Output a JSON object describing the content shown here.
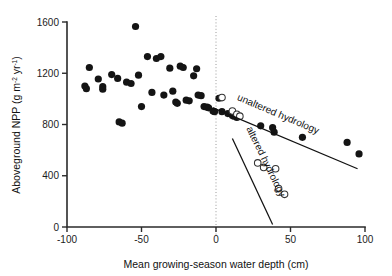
{
  "chart_data": {
    "type": "scatter",
    "title": "",
    "xlabel": "Mean growing-season water depth (cm)",
    "ylabel": "Aboveground NPP (g m-2 yr-1)",
    "ylabel_parts": {
      "prefix": "Aboveground NPP (g m",
      "sup1": "-2",
      "mid": " yr",
      "sup2": "-1",
      "suffix": ")"
    },
    "xlim": [
      -100,
      100
    ],
    "ylim": [
      0,
      1600
    ],
    "xticks": [
      -100,
      -50,
      0,
      50,
      100
    ],
    "xticklabels": [
      "-100",
      "-50",
      "0",
      "50",
      "100"
    ],
    "yticks": [
      0,
      400,
      800,
      1200,
      1600
    ],
    "yticklabels": [
      "0",
      "400",
      "800",
      "1200",
      "1600"
    ],
    "grid": false,
    "legend_position": "inline-annotation",
    "reference_lines": [
      {
        "name": "zero-water-depth",
        "orientation": "vertical",
        "value": 0,
        "style": "dotted",
        "color": "#9a9a9a"
      }
    ],
    "series": [
      {
        "name": "unaltered hydrology",
        "marker": "filled-circle",
        "color": "#141414",
        "points": [
          [
            -88,
            1100
          ],
          [
            -87,
            1080
          ],
          [
            -85,
            1245
          ],
          [
            -79,
            1155
          ],
          [
            -76,
            1095
          ],
          [
            -76,
            1075
          ],
          [
            -70,
            1190
          ],
          [
            -66,
            1160
          ],
          [
            -65,
            820
          ],
          [
            -63,
            810
          ],
          [
            -60,
            1130
          ],
          [
            -57,
            1120
          ],
          [
            -54,
            1565
          ],
          [
            -52,
            1185
          ],
          [
            -50,
            940
          ],
          [
            -46,
            1330
          ],
          [
            -43,
            1050
          ],
          [
            -40,
            1315
          ],
          [
            -37,
            1330
          ],
          [
            -35,
            1030
          ],
          [
            -31,
            1240
          ],
          [
            -29,
            1060
          ],
          [
            -27,
            975
          ],
          [
            -26,
            965
          ],
          [
            -24,
            1255
          ],
          [
            -22,
            1245
          ],
          [
            -20,
            990
          ],
          [
            -18,
            985
          ],
          [
            -15,
            1180
          ],
          [
            -13,
            1235
          ],
          [
            -12,
            1030
          ],
          [
            -10,
            1025
          ],
          [
            -8,
            940
          ],
          [
            -6,
            935
          ],
          [
            -5,
            930
          ],
          [
            -2,
            905
          ],
          [
            -1,
            900
          ],
          [
            2,
            1005
          ],
          [
            4,
            900
          ],
          [
            8,
            885
          ],
          [
            11,
            870
          ],
          [
            12,
            865
          ],
          [
            14,
            855
          ],
          [
            30,
            790
          ],
          [
            38,
            775
          ],
          [
            39,
            740
          ],
          [
            58,
            700
          ],
          [
            88,
            660
          ],
          [
            96,
            570
          ]
        ]
      },
      {
        "name": "altered hydrology",
        "marker": "open-circle",
        "color": "#333333",
        "points": [
          [
            4,
            1010
          ],
          [
            11,
            905
          ],
          [
            14,
            880
          ],
          [
            16,
            865
          ],
          [
            28,
            500
          ],
          [
            32,
            465
          ],
          [
            40,
            455
          ],
          [
            42,
            300
          ],
          [
            46,
            255
          ]
        ]
      }
    ],
    "fit_lines": [
      {
        "name": "unaltered hydrology",
        "label": "unaltered hydrology",
        "x_start": -2,
        "y_start": 930,
        "x_end": 95,
        "y_end": 455,
        "label_angle_deg": 23,
        "label_x": 277,
        "label_y": 117
      },
      {
        "name": "altered hydrology",
        "label": "altered hydrology",
        "x_start": 11,
        "y_start": 690,
        "x_end": 38,
        "y_end": 20,
        "label_angle_deg": 64,
        "label_x": 263,
        "label_y": 163
      }
    ]
  },
  "geometry": {
    "x_axis_px": {
      "left": 67,
      "right": 365,
      "y": 227
    },
    "y_axis_px": {
      "top": 22,
      "bottom": 227,
      "x": 67
    }
  }
}
